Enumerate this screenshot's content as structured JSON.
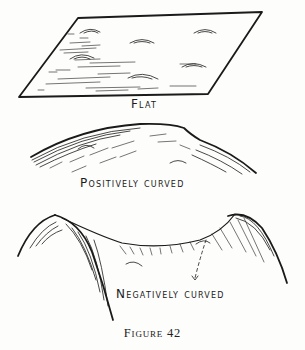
{
  "figure": {
    "caption": "Figure 42",
    "panels": [
      {
        "id": "flat",
        "label": "Flat",
        "shape": "parallelogram-plane"
      },
      {
        "id": "positive",
        "label": "Positively curved",
        "shape": "dome-arc"
      },
      {
        "id": "negative",
        "label": "Negatively curved",
        "shape": "saddle"
      }
    ]
  },
  "colors": {
    "ink": "#1a1a1a",
    "paper": "#fdfdfc"
  }
}
